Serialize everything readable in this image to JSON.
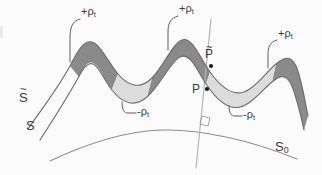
{
  "figure": {
    "type": "geometric-diagram",
    "width": 322,
    "height": 175,
    "background_color": "#fbfbfb"
  },
  "colors": {
    "positive_fill": "#8a8a8a",
    "negative_fill": "#dcdcdc",
    "curve_stroke": "#6d6d6d",
    "base_curve_stroke": "#8d8d8d",
    "normal_line_stroke": "#b3b3b3",
    "leader_stroke": "#555555",
    "point_marker": "#1c1c1c",
    "text_color": "#3a3a3a"
  },
  "labels": {
    "rho_positive_left": {
      "sign": "+",
      "symbol": "ρ",
      "subscript": "t"
    },
    "rho_positive_mid": {
      "sign": "+",
      "symbol": "ρ",
      "subscript": "t"
    },
    "rho_positive_right": {
      "sign": "+",
      "symbol": "ρ",
      "subscript": "t"
    },
    "rho_negative_left": {
      "sign": "-",
      "symbol": "ρ",
      "subscript": "t"
    },
    "rho_negative_right": {
      "sign": "-",
      "symbol": "ρ",
      "subscript": "t"
    },
    "surface_tilde_s": {
      "symbol": "S",
      "accent": "tilde"
    },
    "surface_s": {
      "symbol": "S"
    },
    "surface_s0": {
      "symbol": "S",
      "subscript": "0"
    },
    "point_p_bar": {
      "symbol": "P",
      "accent": "tilde"
    },
    "point_p": {
      "symbol": "P"
    }
  },
  "geometry": {
    "curve_s_tilde": "M 28,129 C 44,106 58,88 70,66 C 78,50 84,40 92,42 C 100,44 108,62 118,74 C 128,86 140,90 152,78 C 164,66 172,44 182,40 C 192,36 200,58 210,72 C 220,86 232,96 244,92 C 256,88 266,72 276,64 C 284,57 291,55 296,66 C 301,77 304,96 308,116",
    "curve_s": "M 40,140 C 54,118 66,100 78,78 C 84,67 88,62 93,64 C 99,66 104,80 112,90 C 122,103 134,108 147,97 C 160,86 170,62 180,57 C 190,52 197,70 206,84 C 216,99 228,110 240,107 C 252,104 262,90 272,82 C 280,75 286,74 291,84 C 296,95 300,112 304,130",
    "curve_s0": "M 50,161 C 90,142 130,131 162,130 C 200,129 250,140 297,159",
    "normal_line": "M 211,19 L 196,168",
    "right_angle_marker": "M 202,116 L 210,118 L 208,126 L 200,124 Z",
    "fill_positive_left": "M 79,77 C 84,66 88,61 93,63 C 99,65 104,79 112,89 L 118,74 C 108,62 100,44 92,42 C 84,40 78,50 70,66 Z",
    "fill_positive_mid": "M 147,97 C 160,86 170,62 180,57 C 190,52 197,70 206,84 L 210,72 C 200,58 192,36 182,40 C 172,44 164,66 152,78 Z",
    "fill_positive_right": "M 272,82 C 280,75 286,74 291,84 C 296,95 300,112 304,130 L 308,116 C 304,96 301,77 296,66 C 291,55 284,57 276,64 Z",
    "fill_negative_left": "M 112,89 C 122,102 134,107 147,96 L 152,78 C 140,90 128,86 118,74 Z",
    "fill_negative_right": "M 206,84 C 216,99 228,110 240,107 C 252,104 262,90 272,82 L 276,64 C 266,72 256,88 244,92 C 232,96 220,86 210,72 Z",
    "leader_rho_pos_left": "M 80,19 C 72,21 70,28 70,38 L 70,62",
    "leader_rho_pos_mid": "M 178,16 C 170,18 168,24 168,32 L 168,50",
    "leader_rho_pos_right": "M 277,40 C 269,42 268,48 268,55 L 268,68",
    "leader_rho_neg_left": "M 122,102 C 122,110 124,113 128,113 L 136,113",
    "leader_rho_neg_right": "M 229,106 C 229,113 231,116 235,116 L 242,116",
    "point_p_bar": {
      "x": 211,
      "y": 66
    },
    "point_p": {
      "x": 207,
      "y": 89
    }
  }
}
